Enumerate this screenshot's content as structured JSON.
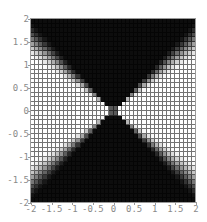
{
  "chart_data": {
    "type": "heatmap",
    "title": "",
    "xlabel": "",
    "ylabel": "",
    "xlim": [
      -2,
      2
    ],
    "ylim": [
      -2,
      2
    ],
    "grid_resolution": [
      40,
      40
    ],
    "grid": true,
    "colormap": "grayscale (black=low, white=high)",
    "pattern": "bright in left/right wedges where |y| < ~0.75|x|, dark in top/bottom wedges where |y| > |x|; gray cell at origin",
    "z_model": {
      "kind": "angular_smoothstep",
      "ratio_low": 0.55,
      "ratio_high": 1.0,
      "center_value": 0.35
    },
    "x_ticks": [
      "-2",
      "-1.5",
      "-1",
      "-0.5",
      "0",
      "0.5",
      "1",
      "1.5",
      "2"
    ],
    "y_ticks": [
      "-2",
      "-1.5",
      "-1",
      "-0.5",
      "0",
      "0.5",
      "1",
      "1.5",
      "2"
    ],
    "x_tick_values": [
      -2,
      -1.5,
      -1,
      -0.5,
      0,
      0.5,
      1,
      1.5,
      2
    ],
    "y_tick_values": [
      -2,
      -1.5,
      -1,
      -0.5,
      0,
      0.5,
      1,
      1.5,
      2
    ]
  }
}
